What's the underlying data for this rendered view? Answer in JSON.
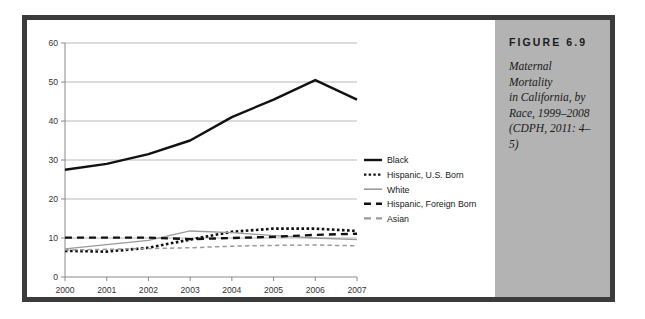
{
  "figure": {
    "number_label": "FIGURE 6.9",
    "caption_lines": [
      "Maternal Mortality",
      "in California, by",
      "Race, 1999–2008",
      "(CDPH, 2011: 4–5)"
    ],
    "caption_full": "Maternal Mortality in California, by Race, 1999–2008 (CDPH, 2011: 4–5)"
  },
  "colors": {
    "frame": "#3b3b3b",
    "caption_panel": "#b3b3b3",
    "gridline": "#b9b9b9",
    "axis": "#8a8a8a",
    "black_series": "#111111",
    "white_series": "#9a9a9a",
    "asian_series": "#9a9a9a",
    "text": "#333333"
  },
  "chart_data": {
    "type": "line",
    "title": "",
    "xlabel": "",
    "ylabel": "",
    "x": [
      2000,
      2001,
      2002,
      2003,
      2004,
      2005,
      2006,
      2007
    ],
    "categories": [
      "2000",
      "2001",
      "2002",
      "2003",
      "2004",
      "2005",
      "2006",
      "2007"
    ],
    "ylim": [
      0,
      60
    ],
    "yticks": [
      0,
      10,
      20,
      30,
      40,
      50,
      60
    ],
    "ytick_labels": [
      "0",
      "10",
      "20",
      "30",
      "40",
      "50",
      "60"
    ],
    "grid": true,
    "grid_axis": "y",
    "legend_position": "right",
    "series": [
      {
        "name": "Black",
        "style": "solid",
        "color": "#111111",
        "width": 2.4,
        "values": [
          27.5,
          29.0,
          31.5,
          35.0,
          41.0,
          45.5,
          50.5,
          45.5
        ]
      },
      {
        "name": "Hispanic, U.S. Born",
        "style": "dotted",
        "color": "#111111",
        "width": 2.6,
        "values": [
          6.7,
          6.5,
          7.5,
          9.6,
          11.6,
          12.4,
          12.4,
          11.8
        ]
      },
      {
        "name": "White",
        "style": "solid",
        "color": "#9a9a9a",
        "width": 1.3,
        "values": [
          7.2,
          8.3,
          9.4,
          11.8,
          11.4,
          10.6,
          10.0,
          9.6
        ]
      },
      {
        "name": "Hispanic, Foreign Born",
        "style": "dashed",
        "color": "#111111",
        "width": 2.4,
        "values": [
          10.1,
          10.1,
          10.1,
          9.7,
          10.0,
          10.3,
          10.8,
          11.1
        ]
      },
      {
        "name": "Asian",
        "style": "dashed",
        "color": "#9a9a9a",
        "width": 1.5,
        "values": [
          6.9,
          7.1,
          7.3,
          7.5,
          7.9,
          8.1,
          8.2,
          8.0
        ]
      }
    ]
  },
  "legend": {
    "items": [
      {
        "label": "Black",
        "style": "solid",
        "color": "#111111"
      },
      {
        "label": "Hispanic, U.S. Born",
        "style": "dotted",
        "color": "#111111"
      },
      {
        "label": "White",
        "style": "solid",
        "color": "#9a9a9a"
      },
      {
        "label": "Hispanic, Foreign Born",
        "style": "dashed",
        "color": "#111111"
      },
      {
        "label": "Asian",
        "style": "dashed",
        "color": "#9a9a9a"
      }
    ]
  }
}
